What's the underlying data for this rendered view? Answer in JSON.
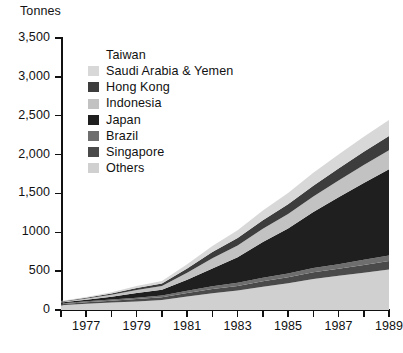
{
  "axes": {
    "y_title": "Tonnes",
    "y_ticks": [
      "3,500",
      "3,000",
      "2,500",
      "2,000",
      "1,500",
      "1000",
      "500",
      "0"
    ],
    "y_tick_values": [
      3500,
      3000,
      2500,
      2000,
      1500,
      1000,
      500,
      0
    ],
    "x_labels": [
      "1977",
      "1979",
      "1981",
      "1983",
      "1985",
      "1987",
      "1989"
    ],
    "x_label_values": [
      1977,
      1979,
      1981,
      1983,
      1985,
      1987,
      1989
    ]
  },
  "legend": {
    "items": [
      {
        "label": "Taiwan",
        "color": "#ffffff",
        "has_swatch": false
      },
      {
        "label": "Saudi Arabia & Yemen",
        "color": "#d8d8d8",
        "has_swatch": true
      },
      {
        "label": "Hong Kong",
        "color": "#3d3d3d",
        "has_swatch": true
      },
      {
        "label": "Indonesia",
        "color": "#c2c2c2",
        "has_swatch": true
      },
      {
        "label": "Japan",
        "color": "#1f1f1f",
        "has_swatch": true
      },
      {
        "label": "Brazil",
        "color": "#6e6e6e",
        "has_swatch": true
      },
      {
        "label": "Singapore",
        "color": "#4a4a4a",
        "has_swatch": true
      },
      {
        "label": "Others",
        "color": "#d0d0d0",
        "has_swatch": true
      }
    ]
  },
  "footer": {
    "artifact_text": ""
  },
  "chart_data": {
    "type": "area",
    "stacked": true,
    "title": "",
    "xlabel": "",
    "ylabel": "Tonnes",
    "ylim": [
      0,
      3500
    ],
    "xlim": [
      1976,
      1989
    ],
    "grid": false,
    "legend_position": "inside-top-left",
    "x": [
      1976,
      1977,
      1978,
      1979,
      1980,
      1981,
      1982,
      1983,
      1984,
      1985,
      1986,
      1987,
      1988,
      1989
    ],
    "stack_order_bottom_to_top": [
      "Others",
      "Singapore",
      "Brazil",
      "Japan",
      "Indonesia",
      "Hong Kong",
      "Saudi Arabia & Yemen",
      "Taiwan"
    ],
    "series": [
      {
        "name": "Others",
        "color": "#d0d0d0",
        "values": [
          60,
          80,
          95,
          110,
          130,
          175,
          215,
          250,
          300,
          345,
          400,
          440,
          480,
          520
        ]
      },
      {
        "name": "Singapore",
        "color": "#4a4a4a",
        "values": [
          15,
          20,
          25,
          30,
          35,
          45,
          55,
          60,
          70,
          75,
          85,
          90,
          100,
          110
        ]
      },
      {
        "name": "Brazil",
        "color": "#6e6e6e",
        "values": [
          10,
          12,
          15,
          18,
          20,
          28,
          35,
          40,
          45,
          50,
          55,
          60,
          65,
          70
        ]
      },
      {
        "name": "Japan",
        "color": "#1f1f1f",
        "values": [
          10,
          20,
          35,
          60,
          75,
          140,
          230,
          330,
          460,
          580,
          720,
          860,
          990,
          1110
        ]
      },
      {
        "name": "Indonesia",
        "color": "#c2c2c2",
        "values": [
          8,
          15,
          25,
          40,
          50,
          90,
          130,
          150,
          170,
          185,
          200,
          215,
          230,
          245
        ]
      },
      {
        "name": "Hong Kong",
        "color": "#3d3d3d",
        "values": [
          6,
          10,
          16,
          24,
          30,
          55,
          80,
          95,
          110,
          125,
          140,
          155,
          170,
          185
        ]
      },
      {
        "name": "Saudi Arabia & Yemen",
        "color": "#d8d8d8",
        "values": [
          6,
          10,
          16,
          26,
          32,
          55,
          80,
          100,
          125,
          145,
          165,
          180,
          195,
          205
        ]
      },
      {
        "name": "Taiwan",
        "color": "#ffffff",
        "values": [
          0,
          0,
          0,
          0,
          0,
          0,
          0,
          0,
          0,
          0,
          0,
          0,
          0,
          0
        ]
      }
    ],
    "totals": [
      115,
      167,
      227,
      308,
      372,
      588,
      825,
      1025,
      1280,
      1505,
      1765,
      2000,
      2230,
      2445
    ]
  }
}
